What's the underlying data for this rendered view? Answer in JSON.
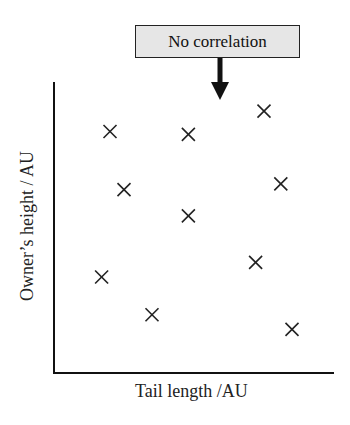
{
  "annotation": {
    "text": "No correlation",
    "box_color": "#e6e6e6"
  },
  "chart_data": {
    "type": "scatter",
    "title": "",
    "xlabel": "Tail length /AU",
    "ylabel": "Owner’s height / AU",
    "marker": "x",
    "grid": false,
    "ticks": false,
    "annotation": "No correlation",
    "points": [
      {
        "x": 2.0,
        "y": 8.3
      },
      {
        "x": 4.8,
        "y": 8.2
      },
      {
        "x": 7.5,
        "y": 9.0
      },
      {
        "x": 2.5,
        "y": 6.3
      },
      {
        "x": 8.1,
        "y": 6.5
      },
      {
        "x": 4.8,
        "y": 5.4
      },
      {
        "x": 1.7,
        "y": 3.3
      },
      {
        "x": 7.2,
        "y": 3.8
      },
      {
        "x": 3.5,
        "y": 2.0
      },
      {
        "x": 8.5,
        "y": 1.5
      }
    ],
    "xlim": [
      0,
      10
    ],
    "ylim": [
      0,
      10
    ]
  }
}
